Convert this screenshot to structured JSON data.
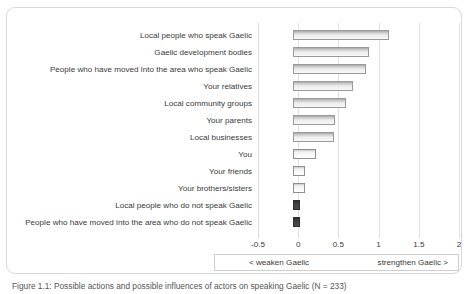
{
  "chart_data": {
    "type": "bar",
    "orientation": "horizontal",
    "title": "",
    "xlabel": "",
    "ylabel": "",
    "xlim": [
      -0.5,
      2
    ],
    "xticks": [
      -0.5,
      0,
      0.5,
      1,
      1.5,
      2
    ],
    "xtick_labels": [
      "-0.5",
      "0",
      "0.5",
      "1",
      "1.5",
      "2"
    ],
    "grid": true,
    "legend_position": "below-axis",
    "categories": [
      "Local people who speak Gaelic",
      "Gaelic development bodies",
      "People who have moved into the area who speak Gaelic",
      "Your relatives",
      "Local community groups",
      "Your parents",
      "Local businesses",
      "You",
      "Your friends",
      "Your brothers/sisters",
      "Local people who do not speak Gaelic",
      "People who have moved into the area who do not speak Gaelic"
    ],
    "values": [
      1.13,
      0.88,
      0.84,
      0.68,
      0.59,
      0.46,
      0.45,
      0.22,
      0.09,
      0.08,
      0.02,
      0.02
    ],
    "bar_start": -0.06,
    "bar_styles": [
      "light-grey",
      "light-grey",
      "light-grey",
      "light-grey",
      "light-grey",
      "light-grey",
      "light-grey",
      "white",
      "white",
      "white",
      "dark",
      "dark"
    ],
    "annotations": {
      "left_direction": "< weaken Gaelic",
      "right_direction": "strengthen Gaelic >"
    }
  },
  "axis": {
    "tick_labels": [
      "-0.5",
      "0",
      "0.5",
      "1",
      "1.5",
      "2"
    ]
  },
  "legend": {
    "weaken": "< weaken Gaelic",
    "strengthen": "strengthen Gaelic >"
  },
  "caption": {
    "text": "Figure 1.1: Possible actions and possible influences of actors on speaking Gaelic (N = 233)"
  },
  "colors": {
    "bar_fill_light": "#ededed",
    "bar_fill_white": "#ffffff",
    "bar_fill_dark": "#3d3d3d",
    "bar_border": "#9a9a9a",
    "gridline": "#e2e2e2",
    "frame_border": "#d8d8d8",
    "text": "#3a3a3a"
  }
}
